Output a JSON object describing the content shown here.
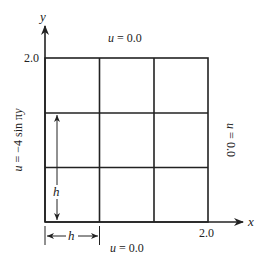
{
  "diagram": {
    "type": "finite-difference grid",
    "grid": {
      "rows": 3,
      "cols": 3
    },
    "axes": {
      "x_label": "x",
      "y_label": "y",
      "x_max_tick": "2.0",
      "y_max_tick": "2.0"
    },
    "boundary_conditions": {
      "top": "u = 0.0",
      "bottom": "u = 0.0",
      "right": "u = 0.0",
      "left": "u = −4 sin πy"
    },
    "spacing": {
      "vertical_label": "h",
      "horizontal_label": "h"
    },
    "colors": {
      "line": "#222222",
      "background": "#ffffff"
    }
  }
}
